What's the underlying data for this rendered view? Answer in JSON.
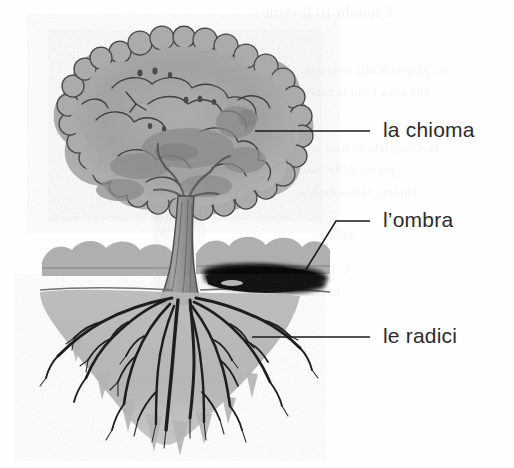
{
  "figure": {
    "kind": "labelled-botanical-diagram",
    "language": "Italian",
    "background_color": "#fefefe"
  },
  "labels": [
    {
      "id": "chioma",
      "text": "la chioma",
      "meaning_part": "crown / canopy",
      "color": "#2b2b2b",
      "leader": {
        "type": "straight",
        "x1": 255,
        "y1": 131,
        "x2": 370,
        "y2": 131
      }
    },
    {
      "id": "ombra",
      "text": "l’ombra",
      "meaning_part": "shadow",
      "color": "#2b2b2b",
      "leader": {
        "type": "elbow",
        "x1": 305,
        "y1": 271,
        "x2": 336,
        "y2": 221,
        "x3": 370,
        "y3": 221
      }
    },
    {
      "id": "radici",
      "text": "le radici",
      "meaning_part": "roots",
      "color": "#2b2b2b",
      "leader": {
        "type": "straight",
        "x1": 252,
        "y1": 337,
        "x2": 370,
        "y2": 337
      }
    }
  ],
  "illustration": {
    "style": "grayscale hand-drawn pen-and-wash",
    "colors": {
      "foliage_light": "#b4b4b4",
      "foliage_mid": "#9b9b9b",
      "foliage_dark": "#868686",
      "ink": "#3a3a3a",
      "trunk": "#8e8e8e",
      "soil": "#b0b0b0",
      "soil_dark": "#9a9a9a",
      "shadow": "#0a0a0a",
      "ground_line": "#6e6e6e"
    },
    "parts": [
      {
        "name": "crown",
        "label_ref": "chioma"
      },
      {
        "name": "trunk",
        "label_ref": null
      },
      {
        "name": "ground-line",
        "label_ref": null
      },
      {
        "name": "background-shrubs",
        "label_ref": null
      },
      {
        "name": "cast-shadow",
        "label_ref": "ombra"
      },
      {
        "name": "soil-mass",
        "label_ref": null
      },
      {
        "name": "root-system",
        "label_ref": "radici"
      }
    ]
  },
  "ghost_text": [
    {
      "x": 262,
      "y": 4,
      "size": 15,
      "text": "Capitolo 10  Il verde"
    },
    {
      "x": 300,
      "y": 62,
      "size": 13,
      "text": "A.  Rispondi alle domande"
    },
    {
      "x": 300,
      "y": 84,
      "size": 13,
      "text": "che cosa sono le radici"
    },
    {
      "x": 300,
      "y": 140,
      "size": 13,
      "text": "B.  Completa le frasi con"
    },
    {
      "x": 300,
      "y": 162,
      "size": 13,
      "text": "parole della lista"
    },
    {
      "x": 300,
      "y": 184,
      "size": 13,
      "text": "chioma  radici  ombra"
    },
    {
      "x": 318,
      "y": 228,
      "size": 13,
      "text": "Albero"
    },
    {
      "x": 300,
      "y": 262,
      "size": 13,
      "text": "1. Il sole"
    },
    {
      "x": 300,
      "y": 284,
      "size": 13,
      "text": "terreno"
    }
  ]
}
